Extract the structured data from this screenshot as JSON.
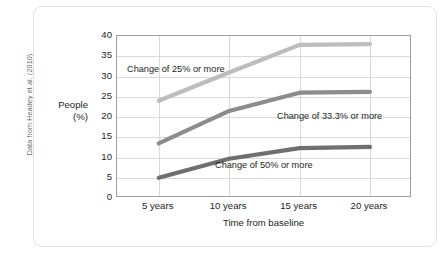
{
  "credit": "Data from Headey et al. (2010)",
  "chart_data": {
    "type": "line",
    "title": "",
    "xlabel": "Time from baseline",
    "ylabel": "People\n(%)",
    "ylabel_line1": "People",
    "ylabel_line2": "(%)",
    "categories": [
      "5 years",
      "10 years",
      "15 years",
      "20 years"
    ],
    "yticks": [
      40,
      35,
      30,
      25,
      20,
      15,
      10,
      5,
      0
    ],
    "ylim": [
      0,
      40
    ],
    "grid": true,
    "legend_position": "inline-annotations",
    "series": [
      {
        "name": "Change of 25% or more",
        "color": "#bdbdbd",
        "values": [
          24.0,
          31.0,
          37.8,
          38.0
        ],
        "annotation": "Change of 25% or more"
      },
      {
        "name": "Change of 33.3% or more",
        "color": "#8c8c8c",
        "values": [
          13.5,
          21.5,
          26.0,
          26.2
        ],
        "annotation": "Change of 33.3% or more"
      },
      {
        "name": "Change of 50% or more",
        "color": "#6f6f6f",
        "values": [
          5.0,
          9.7,
          12.3,
          12.6
        ],
        "annotation": "Change of 50% or more"
      }
    ]
  }
}
